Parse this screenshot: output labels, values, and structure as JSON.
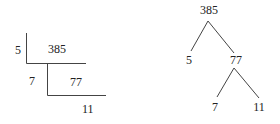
{
  "division_ladder": {
    "rows": [
      {
        "divisor": "5",
        "dividend": "385"
      },
      {
        "divisor": "7",
        "dividend": "77"
      },
      {
        "divisor": "",
        "dividend": "11"
      }
    ]
  },
  "factor_tree": {
    "root": "385",
    "level1": {
      "left": "5",
      "right": "77"
    },
    "level2": {
      "left": "7",
      "right": "11"
    }
  }
}
